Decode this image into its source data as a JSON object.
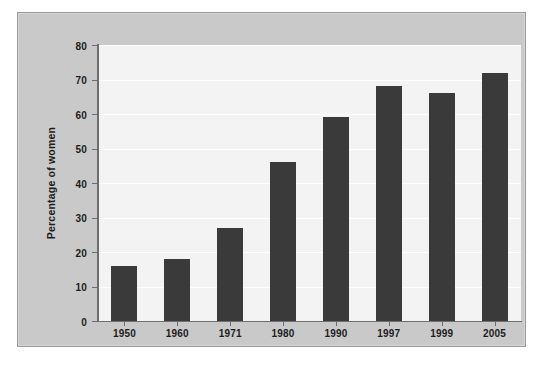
{
  "chart_data": {
    "type": "bar",
    "title": "",
    "subtitle": "",
    "xlabel": "",
    "ylabel": "Percentage of women",
    "categories": [
      "1950",
      "1960",
      "1971",
      "1980",
      "1990",
      "1997",
      "1999",
      "2005"
    ],
    "values": [
      16,
      18,
      27,
      46,
      59,
      68,
      66,
      72
    ],
    "ylim": [
      0,
      80
    ],
    "ytick_labels": [
      "0",
      "10",
      "20",
      "30",
      "40",
      "50",
      "60",
      "70",
      "80"
    ],
    "ytick_values": [
      0,
      10,
      20,
      30,
      40,
      50,
      60,
      70,
      80
    ],
    "grid": true,
    "legend": false,
    "legend_position": "none",
    "bar_color": "#3a3a3a",
    "plot_background": "#f3f3f3",
    "figure_background": "#c9c9c9",
    "gridline_color": "#ffffff",
    "axis_color": "#6e6e6e",
    "text_color": "#1c1c1c"
  }
}
